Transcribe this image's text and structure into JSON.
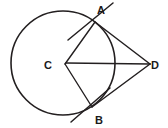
{
  "figure": {
    "background_color": "#ffffff",
    "stroke_color": "#231f20",
    "label_color": "#1a1a1a",
    "width": 168,
    "height": 128
  },
  "circle": {
    "name": "circle-C",
    "center_x": 63,
    "center_y": 63,
    "radius": 52,
    "stroke_width": 1.6
  },
  "points": {
    "A": {
      "label": "A",
      "x": 95,
      "y": 22,
      "label_x": 101,
      "label_y": 14
    },
    "B": {
      "label": "B",
      "x": 92,
      "y": 107,
      "label_x": 99,
      "label_y": 124
    },
    "C": {
      "label": "C",
      "x": 63,
      "y": 63,
      "label_x": 48,
      "label_y": 69
    },
    "D": {
      "label": "D",
      "x": 150,
      "y": 64,
      "label_x": 155,
      "label_y": 69
    }
  },
  "segments": [
    {
      "name": "radius-CA",
      "x1": 65,
      "y1": 64,
      "x2": 95,
      "y2": 22
    },
    {
      "name": "radius-CB",
      "x1": 65,
      "y1": 64,
      "x2": 92,
      "y2": 107
    },
    {
      "name": "segment-CD",
      "x1": 66,
      "y1": 63,
      "x2": 150,
      "y2": 64
    },
    {
      "name": "segment-AD",
      "x1": 95,
      "y1": 22,
      "x2": 150,
      "y2": 64
    },
    {
      "name": "segment-BD",
      "x1": 92,
      "y1": 107,
      "x2": 150,
      "y2": 64
    }
  ],
  "tangents": [
    {
      "name": "tangent-at-A",
      "x1": 113,
      "y1": 3,
      "x2": 68,
      "y2": 40
    },
    {
      "name": "tangent-at-B",
      "x1": 110,
      "y1": 88,
      "x2": 71,
      "y2": 122
    }
  ]
}
